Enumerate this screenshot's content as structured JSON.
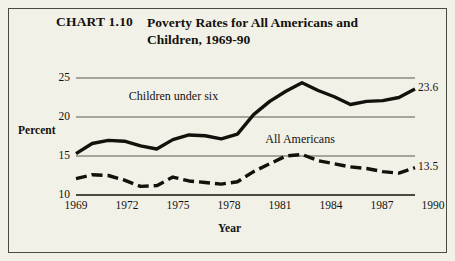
{
  "figure": {
    "number": "CHART 1.10",
    "title": "Poverty Rates for All Americans and Children, 1969-90",
    "background": "#f2f1e8",
    "border_color": "#4a4a42",
    "ink_color": "#14110d"
  },
  "chart_data": {
    "type": "line",
    "title": "Poverty Rates for All Americans and Children, 1969-90",
    "xlabel": "Year",
    "ylabel": "Percent",
    "xlim": [
      1969,
      1990
    ],
    "ylim": [
      10,
      25
    ],
    "yticks": [
      10,
      15,
      20,
      25
    ],
    "xticks": [
      1969,
      1972,
      1975,
      1978,
      1981,
      1984,
      1987,
      1990
    ],
    "grid": "horizontal",
    "legend": "inline-annotations",
    "x": [
      1969,
      1970,
      1971,
      1972,
      1973,
      1974,
      1975,
      1976,
      1977,
      1978,
      1979,
      1980,
      1981,
      1982,
      1983,
      1984,
      1985,
      1986,
      1987,
      1988,
      1989,
      1990
    ],
    "series": [
      {
        "name": "Children under six",
        "style": "solid",
        "label_x": 1975.0,
        "label_y": 22.6,
        "end_value_label": "23.6",
        "values": [
          15.3,
          16.6,
          17.0,
          16.9,
          16.3,
          15.9,
          17.1,
          17.7,
          17.6,
          17.2,
          17.8,
          20.3,
          22.0,
          23.3,
          24.4,
          23.4,
          22.6,
          21.6,
          22.0,
          22.1,
          22.5,
          23.6
        ]
      },
      {
        "name": "All Americans",
        "style": "dashed",
        "label_x": 1983.2,
        "label_y": 17.0,
        "end_value_label": "13.5",
        "values": [
          12.1,
          12.6,
          12.5,
          11.9,
          11.1,
          11.2,
          12.3,
          11.8,
          11.6,
          11.4,
          11.7,
          13.0,
          14.0,
          15.0,
          15.2,
          14.4,
          14.0,
          13.6,
          13.4,
          13.0,
          12.8,
          13.5
        ]
      }
    ]
  },
  "axes": {
    "y_axis_title": "Percent",
    "x_axis_title": "Year",
    "y_tick_labels": [
      "25",
      "20",
      "15",
      "10"
    ],
    "x_tick_labels": [
      "1969",
      "1972",
      "1975",
      "1978",
      "1981",
      "1984",
      "1987",
      "1990"
    ]
  }
}
